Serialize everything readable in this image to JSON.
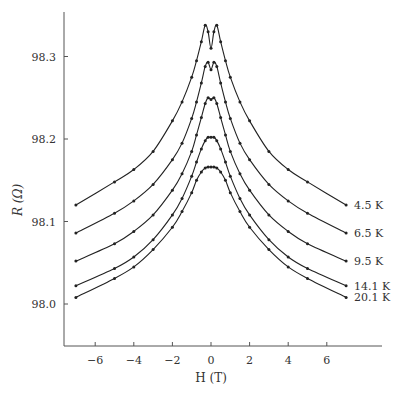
{
  "chart_data": {
    "type": "line",
    "title": "",
    "xlabel": "H (T)",
    "ylabel": "R (Ω)",
    "xlim": [
      -7.6,
      9.0
    ],
    "ylim": [
      97.946,
      98.352
    ],
    "xticks": [
      -6,
      -4,
      -2,
      0,
      2,
      4,
      6
    ],
    "yticks": [
      98.0,
      98.1,
      98.2,
      98.3
    ],
    "ytick_labels": [
      "98.0",
      "98.1",
      "98.2",
      "98.3"
    ],
    "grid": false,
    "legend": "inline labels at right end of each curve",
    "x": [
      -7,
      -5,
      -4,
      -3,
      -2,
      -1.5,
      -1,
      -0.75,
      -0.5,
      -0.3,
      -0.15,
      0,
      0.15,
      0.3,
      0.5,
      0.75,
      1,
      1.5,
      2,
      3,
      4,
      5,
      7
    ],
    "series": [
      {
        "name": "4.5 K",
        "label": "4.5 K",
        "values": [
          98.12,
          98.148,
          98.163,
          98.185,
          98.222,
          98.245,
          98.275,
          98.295,
          98.318,
          98.338,
          98.33,
          98.31,
          98.33,
          98.338,
          98.318,
          98.295,
          98.275,
          98.245,
          98.222,
          98.185,
          98.163,
          98.148,
          98.12
        ]
      },
      {
        "name": "6.5 K",
        "label": "6.5 K",
        "values": [
          98.086,
          98.11,
          98.125,
          98.145,
          98.175,
          98.195,
          98.225,
          98.245,
          98.268,
          98.288,
          98.293,
          98.284,
          98.293,
          98.288,
          98.268,
          98.245,
          98.225,
          98.195,
          98.175,
          98.145,
          98.125,
          98.11,
          98.086
        ]
      },
      {
        "name": "9.5 K",
        "label": "9.5 K",
        "values": [
          98.052,
          98.073,
          98.088,
          98.108,
          98.138,
          98.158,
          98.185,
          98.205,
          98.226,
          98.243,
          98.25,
          98.248,
          98.25,
          98.243,
          98.226,
          98.205,
          98.185,
          98.158,
          98.138,
          98.108,
          98.088,
          98.073,
          98.052
        ]
      },
      {
        "name": "14.1 K",
        "label": "14.1 K",
        "values": [
          98.022,
          98.043,
          98.057,
          98.078,
          98.108,
          98.128,
          98.155,
          98.172,
          98.188,
          98.198,
          98.202,
          98.202,
          98.202,
          98.198,
          98.188,
          98.172,
          98.155,
          98.128,
          98.108,
          98.078,
          98.057,
          98.043,
          98.022
        ]
      },
      {
        "name": "20.1 K",
        "label": "20.1 K",
        "values": [
          98.008,
          98.031,
          98.045,
          98.066,
          98.093,
          98.112,
          98.135,
          98.15,
          98.16,
          98.165,
          98.166,
          98.166,
          98.166,
          98.165,
          98.16,
          98.15,
          98.135,
          98.112,
          98.093,
          98.066,
          98.045,
          98.031,
          98.008
        ]
      }
    ]
  },
  "colors": {
    "line": "#222222",
    "axis": "#555555",
    "text": "#333333"
  }
}
